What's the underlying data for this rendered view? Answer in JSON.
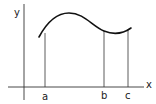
{
  "figure": {
    "type": "function-graph-with-interval-markers",
    "axes": {
      "x_label": "x",
      "y_label": "y"
    },
    "markers": [
      {
        "label": "a"
      },
      {
        "label": "b"
      },
      {
        "label": "c"
      }
    ],
    "colors": {
      "stroke": "#222222",
      "curve": "#111111",
      "background": "#ffffff"
    }
  }
}
